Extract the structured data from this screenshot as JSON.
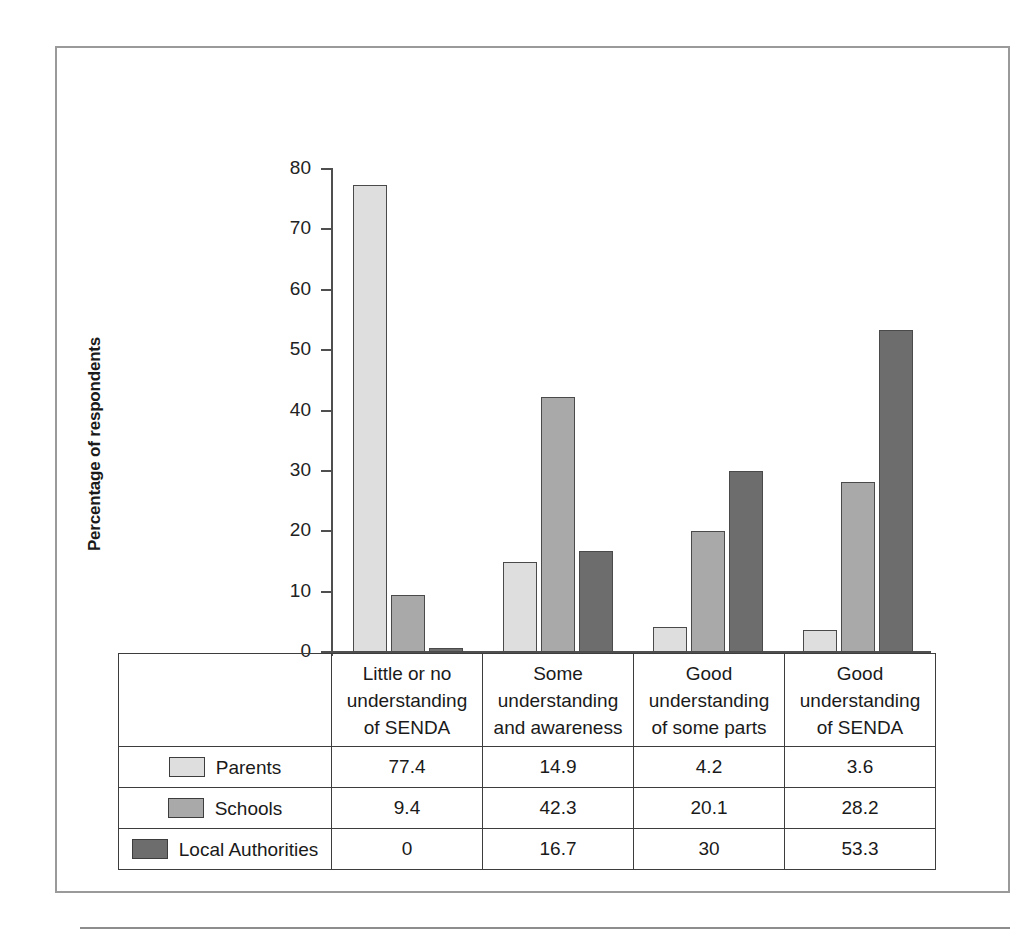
{
  "figure": {
    "number_label": "Figure 7.2",
    "caption": "Parents’/Carers’, Schools’, and Local Authorities’ Levels of Understanding of SENDA (Part 4 of the Disability Discrimination Act)",
    "banner_color": "#b4b4b4",
    "frame_color": "#9a9a9a"
  },
  "chart_data": {
    "type": "bar",
    "title": "Parents’/Carers’, Schools’, and Local Authorities’ Levels of Understanding of SENDA (Part 4 of the Disability Discrimination Act)",
    "xlabel": "",
    "ylabel": "Percentage of respondents",
    "ylim": [
      0,
      80
    ],
    "yticks": [
      0,
      10,
      20,
      30,
      40,
      50,
      60,
      70,
      80
    ],
    "ytick_labels": [
      "0",
      "10",
      "20",
      "30",
      "40",
      "50",
      "60",
      "70",
      "80"
    ],
    "grid": false,
    "legend_position": "table-below",
    "categories": [
      "Little or no understanding of SENDA",
      "Some understanding and awareness",
      "Good understanding of some parts",
      "Good understanding of SENDA"
    ],
    "category_lines": [
      [
        "Little or no",
        "understanding",
        "of SENDA"
      ],
      [
        "Some",
        "understanding",
        "and awareness"
      ],
      [
        "Good",
        "understanding",
        "of some parts"
      ],
      [
        "Good",
        "understanding",
        "of SENDA"
      ]
    ],
    "series": [
      {
        "name": "Parents",
        "color": "#dedede",
        "values": [
          77.4,
          14.9,
          4.2,
          3.6
        ],
        "labels": [
          "77.4",
          "14.9",
          "4.2",
          "3.6"
        ]
      },
      {
        "name": "Schools",
        "color": "#a9a9a9",
        "values": [
          9.4,
          42.3,
          20.1,
          28.2
        ],
        "labels": [
          "9.4",
          "42.3",
          "20.1",
          "28.2"
        ]
      },
      {
        "name": "Local Authorities",
        "color": "#6d6d6d",
        "values": [
          0,
          16.7,
          30,
          53.3
        ],
        "labels": [
          "0",
          "16.7",
          "30",
          "53.3"
        ]
      }
    ]
  }
}
